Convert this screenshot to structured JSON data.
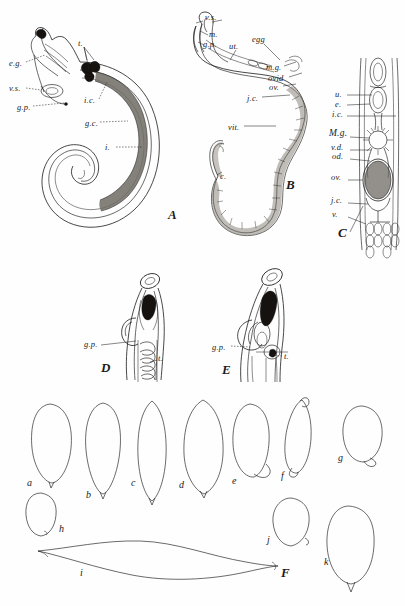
{
  "plate": {
    "title": "Comparative anatomy plate of nematodes and egg outlines",
    "background_color": "#fefefe",
    "ink_color": "#1b1b1b",
    "figure_count": 6
  },
  "figures": [
    {
      "id": "A",
      "letter": "A",
      "caption": "Male worm, entire, coiled",
      "letter_pos": {
        "x": 168,
        "y": 215
      },
      "labels": [
        {
          "key": "e.g.",
          "text": "e.g.",
          "x": 9,
          "y": 64,
          "leader": "dash"
        },
        {
          "key": "v.s.",
          "text": "v.s.",
          "x": 9,
          "y": 89,
          "leader": "dash"
        },
        {
          "key": "g.p.",
          "text": "g.p.",
          "x": 17,
          "y": 108,
          "leader": "dash"
        },
        {
          "key": "t",
          "text": "t.",
          "x": 78,
          "y": 44,
          "leader": "line"
        },
        {
          "key": "i.c.",
          "text": "i.c.",
          "x": 84,
          "y": 101,
          "leader": "dash"
        },
        {
          "key": "g.c.",
          "text": "g.c.",
          "x": 85,
          "y": 124,
          "leader": "dash"
        },
        {
          "key": "i",
          "text": "i.",
          "x": 105,
          "y": 149,
          "leader": "dash"
        }
      ]
    },
    {
      "id": "B",
      "letter": "B",
      "caption": "Female worm, entire",
      "letter_pos": {
        "x": 286,
        "y": 184
      },
      "labels": [
        {
          "key": "v.s.",
          "text": "v.s.",
          "x": 205,
          "y": 18,
          "leader": "line"
        },
        {
          "key": "m",
          "text": "m.",
          "x": 209,
          "y": 35,
          "leader": "line"
        },
        {
          "key": "g.p.",
          "text": "g.p.",
          "x": 205,
          "y": 45,
          "leader": "line"
        },
        {
          "key": "ut",
          "text": "ut.",
          "x": 229,
          "y": 47,
          "leader": "line"
        },
        {
          "key": "egg",
          "text": "egg",
          "x": 254,
          "y": 41,
          "leader": "line"
        },
        {
          "key": "m.g.",
          "text": "m.g.",
          "x": 268,
          "y": 68,
          "leader": "line"
        },
        {
          "key": "ovid",
          "text": "ovid",
          "x": 270,
          "y": 79,
          "leader": "line"
        },
        {
          "key": "ov.",
          "text": "ov.",
          "x": 271,
          "y": 88,
          "leader": "line"
        },
        {
          "key": "j.c.",
          "text": "j.c.",
          "x": 249,
          "y": 99,
          "leader": "line"
        },
        {
          "key": "vit.",
          "text": "vit.",
          "x": 232,
          "y": 128,
          "leader": "line"
        },
        {
          "key": "c",
          "text": "c.",
          "x": 218,
          "y": 177,
          "leader": "line"
        }
      ]
    },
    {
      "id": "C",
      "letter": "C",
      "caption": "Detail of female reproductive tract",
      "letter_pos": {
        "x": 338,
        "y": 232
      },
      "labels": [
        {
          "key": "u",
          "text": "u.",
          "x": 337,
          "y": 95,
          "leader": "line"
        },
        {
          "key": "e",
          "text": "e.",
          "x": 337,
          "y": 105,
          "leader": "line"
        },
        {
          "key": "i.c.",
          "text": "i.c.",
          "x": 334,
          "y": 115,
          "leader": "line"
        },
        {
          "key": "M.g.",
          "text": "M.g.",
          "x": 331,
          "y": 134,
          "leader": "line"
        },
        {
          "key": "v.d.",
          "text": "v.d.",
          "x": 333,
          "y": 148,
          "leader": "line"
        },
        {
          "key": "od.",
          "text": "od.",
          "x": 334,
          "y": 157,
          "leader": "line"
        },
        {
          "key": "ov.",
          "text": "ov.",
          "x": 333,
          "y": 178,
          "leader": "line"
        },
        {
          "key": "j.c.",
          "text": "j.c.",
          "x": 333,
          "y": 201,
          "leader": "line"
        },
        {
          "key": "v",
          "text": "v.",
          "x": 334,
          "y": 215,
          "leader": "line"
        }
      ]
    },
    {
      "id": "D",
      "letter": "D",
      "caption": "Anterior end of male, lateral view",
      "letter_pos": {
        "x": 103,
        "y": 368
      },
      "labels": [
        {
          "key": "g.p.",
          "text": "g.p.",
          "x": 86,
          "y": 345,
          "leader": "line"
        },
        {
          "key": "t",
          "text": "t.",
          "x": 158,
          "y": 359,
          "leader": "line"
        }
      ]
    },
    {
      "id": "E",
      "letter": "E",
      "caption": "Anterior end of male, second species",
      "letter_pos": {
        "x": 224,
        "y": 371
      },
      "labels": [
        {
          "key": "g.p.",
          "text": "g.p.",
          "x": 214,
          "y": 348,
          "leader": "dash"
        },
        {
          "key": "t",
          "text": "t.",
          "x": 284,
          "y": 358,
          "leader": "dash"
        }
      ]
    },
    {
      "id": "F",
      "letter": "F",
      "caption": "Outlines of eggs",
      "letter_pos": {
        "x": 282,
        "y": 572
      },
      "labels": []
    }
  ],
  "egg_outlines": {
    "figure": "F",
    "count": 11,
    "items": [
      {
        "id": "a",
        "label": "a",
        "shape": "ovate, pointed base with short spine",
        "label_x": 27,
        "label_y": 485,
        "cx": 50,
        "cy": 443,
        "rx": 21,
        "ry": 40
      },
      {
        "id": "b",
        "label": "b",
        "shape": "narrow ovate, tapering base",
        "label_x": 86,
        "label_y": 497,
        "cx": 103,
        "cy": 450,
        "rx": 17,
        "ry": 47
      },
      {
        "id": "c",
        "label": "c",
        "shape": "lanceolate, both ends pointed",
        "label_x": 131,
        "label_y": 485,
        "cx": 152,
        "cy": 455,
        "rx": 15,
        "ry": 55
      },
      {
        "id": "d",
        "label": "d",
        "shape": "broad lanceolate",
        "label_x": 179,
        "label_y": 487,
        "cx": 203,
        "cy": 448,
        "rx": 20,
        "ry": 50
      },
      {
        "id": "e",
        "label": "e",
        "shape": "oval with recurved hook at base",
        "label_x": 232,
        "label_y": 483,
        "cx": 250,
        "cy": 441,
        "rx": 18,
        "ry": 38
      },
      {
        "id": "f",
        "label": "f",
        "shape": "asymmetric with apical hook",
        "label_x": 283,
        "label_y": 478,
        "cx": 300,
        "cy": 437,
        "rx": 16,
        "ry": 36
      },
      {
        "id": "g",
        "label": "g",
        "shape": "rounded oval with small beak",
        "label_x": 341,
        "label_y": 460,
        "cx": 362,
        "cy": 432,
        "rx": 19,
        "ry": 30
      },
      {
        "id": "h",
        "label": "h",
        "shape": "small round oval",
        "label_x": 59,
        "label_y": 530,
        "cx": 41,
        "cy": 514,
        "rx": 15,
        "ry": 21
      },
      {
        "id": "i",
        "label": "i",
        "shape": "long flattened spindle",
        "label_x": 80,
        "label_y": 574,
        "cx": 152,
        "cy": 560,
        "rx": 115,
        "ry": 18
      },
      {
        "id": "j",
        "label": "j",
        "shape": "rounded oval with notch",
        "label_x": 269,
        "label_y": 541,
        "cx": 291,
        "cy": 522,
        "rx": 18,
        "ry": 24
      },
      {
        "id": "k",
        "label": "k",
        "shape": "large oval with basal point",
        "label_x": 326,
        "label_y": 563,
        "cx": 349,
        "cy": 545,
        "rx": 23,
        "ry": 39
      }
    ]
  },
  "abbreviations": {
    "e.g.": "ejaculatory gland",
    "v.s.": "vesicula seminalis",
    "g.p.": "genital pore",
    "t.": "testis",
    "i.c.": "intestinal caecum",
    "g.c.": "germinal cells",
    "i.": "intestine",
    "m.": "muscle",
    "ut.": "uterus",
    "egg": "egg",
    "m.g.": "Mehlis gland",
    "ovid": "oviduct",
    "ov.": "ovary",
    "j.c.": "junction cells",
    "vit.": "vitellaria",
    "c.": "caudal end",
    "u.": "uterus",
    "e.": "egg",
    "M.g.": "Mehlis gland",
    "v.d.": "vitelline duct",
    "od.": "oviduct",
    "v.": "vitelline follicles"
  }
}
